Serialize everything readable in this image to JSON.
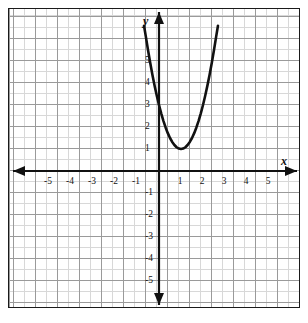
{
  "chart_data": {
    "type": "line",
    "title": "",
    "subtitle": "",
    "xlabel": "x",
    "ylabel": "y",
    "xlim": [
      -6.6,
      6.3
    ],
    "ylim": [
      -6.9,
      6.5
    ],
    "grid": true,
    "legend": null,
    "annotations": [],
    "axis_labels": {
      "x": "x",
      "y": "y"
    },
    "x_ticks": [
      -5,
      -4,
      -3,
      -2,
      -1,
      1,
      2,
      3,
      4,
      5
    ],
    "x_tick_labels": [
      "-5",
      "-4",
      "-3",
      "-2",
      "-1",
      "1",
      "2",
      "3",
      "4",
      "5"
    ],
    "y_ticks": [
      5,
      4,
      3,
      2,
      1,
      -1,
      -2,
      -3,
      -4,
      -5
    ],
    "y_tick_labels": [
      "5",
      "4",
      "3",
      "2",
      "1",
      "-1",
      "-2",
      "-3",
      "-4",
      "-5"
    ],
    "series": [
      {
        "name": "parabola",
        "type": "line",
        "color": "#111111",
        "equation": "y = 2(x - 1)^2 + 1",
        "vertex": [
          1,
          1
        ],
        "opens": "up",
        "points": [
          [
            -0.68,
            6.6
          ],
          [
            -0.6,
            6.12
          ],
          [
            -0.5,
            5.5
          ],
          [
            -0.4,
            4.92
          ],
          [
            -0.3,
            4.38
          ],
          [
            -0.2,
            3.88
          ],
          [
            -0.1,
            3.42
          ],
          [
            0,
            3.0
          ],
          [
            0.1,
            2.62
          ],
          [
            0.2,
            2.28
          ],
          [
            0.3,
            1.98
          ],
          [
            0.4,
            1.72
          ],
          [
            0.5,
            1.5
          ],
          [
            0.6,
            1.32
          ],
          [
            0.7,
            1.18
          ],
          [
            0.8,
            1.08
          ],
          [
            0.9,
            1.02
          ],
          [
            1,
            1.0
          ],
          [
            1.1,
            1.02
          ],
          [
            1.2,
            1.08
          ],
          [
            1.3,
            1.18
          ],
          [
            1.4,
            1.32
          ],
          [
            1.5,
            1.5
          ],
          [
            1.6,
            1.72
          ],
          [
            1.7,
            1.98
          ],
          [
            1.8,
            2.28
          ],
          [
            1.9,
            2.62
          ],
          [
            2,
            3.0
          ],
          [
            2.1,
            3.42
          ],
          [
            2.2,
            3.88
          ],
          [
            2.3,
            4.38
          ],
          [
            2.4,
            4.92
          ],
          [
            2.5,
            5.5
          ],
          [
            2.6,
            6.12
          ],
          [
            2.68,
            6.6
          ]
        ]
      }
    ]
  },
  "axes": {
    "x_axis_name": "x",
    "y_axis_name": "y",
    "arrows": [
      "left",
      "right",
      "up",
      "down"
    ],
    "color": "#111111"
  }
}
